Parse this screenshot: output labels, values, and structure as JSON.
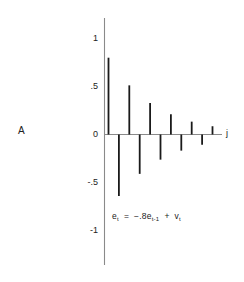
{
  "figure": {
    "panel_label": "A",
    "equation": {
      "lhs_var": "e",
      "lhs_sub": "t",
      "equals": "=",
      "coefficient": "−.8",
      "rhs_var": "e",
      "rhs_sub": "t-1",
      "plus": "+",
      "noise_var": "v",
      "noise_sub": "t",
      "full_text": "eₜ = −.8eₜ₋₁ + vₜ"
    },
    "colors": {
      "axis": "#8a8a8a",
      "bar": "#1a1a1a",
      "text": "#222222",
      "background": "#ffffff"
    }
  },
  "chart_data": {
    "type": "bar",
    "title": "",
    "subtitle": "",
    "xlabel": "j",
    "ylabel": "",
    "annotations": [
      "eₜ = −.8eₜ₋₁ + vₜ",
      "A"
    ],
    "grid": false,
    "legend": false,
    "ylim": [
      -1.15,
      1.15
    ],
    "xlim": [
      0,
      12
    ],
    "ytick_labels": [
      "1",
      ".5",
      "0",
      "-.5",
      "-1"
    ],
    "ytick_values": [
      1,
      0.5,
      0,
      -0.5,
      -1
    ],
    "xtick_labels": [],
    "categories": [
      "1",
      "2",
      "3",
      "4",
      "5",
      "6",
      "7",
      "8",
      "9",
      "10",
      "11"
    ],
    "values": [
      0.8,
      -0.64,
      0.512,
      -0.41,
      0.328,
      -0.262,
      0.21,
      -0.168,
      0.134,
      -0.107,
      0.086
    ],
    "series": [
      {
        "name": "autocorrelation",
        "values": [
          0.8,
          -0.64,
          0.512,
          -0.41,
          0.328,
          -0.262,
          0.21,
          -0.168,
          0.134,
          -0.107,
          0.086
        ]
      }
    ]
  }
}
